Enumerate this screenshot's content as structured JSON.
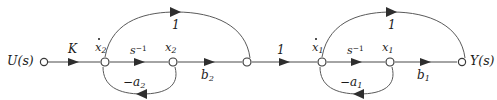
{
  "diagram": {
    "type": "signal-flow-graph",
    "title": "",
    "background_color": "#ffffff",
    "line_color": "#4a4a4a",
    "text_color": "#1a1a1a"
  },
  "nodes": [
    {
      "id": "u",
      "label": "U(s)",
      "label_plain": "U(s)",
      "x": 42,
      "y": 62
    },
    {
      "id": "xd2",
      "label": "x̄2",
      "label_plain": "x-dot 2",
      "x": 105,
      "y": 62
    },
    {
      "id": "x2",
      "label": "x2",
      "label_plain": "x2",
      "x": 173,
      "y": 62
    },
    {
      "id": "mid",
      "label": "",
      "label_plain": "junction",
      "x": 247,
      "y": 62
    },
    {
      "id": "xd1",
      "label": "x̄1",
      "label_plain": "x-dot 1",
      "x": 322,
      "y": 62
    },
    {
      "id": "x1",
      "label": "x1",
      "label_plain": "x1",
      "x": 390,
      "y": 62
    },
    {
      "id": "y",
      "label": "Y(s)",
      "label_plain": "Y(s)",
      "x": 462,
      "y": 62
    }
  ],
  "node_labels": {
    "u": "U(s)",
    "xdot2_base": "x",
    "xdot2_sub": "2",
    "x2_base": "x",
    "x2_sub": "2",
    "xdot1_base": "x",
    "xdot1_sub": "1",
    "x1_base": "x",
    "x1_sub": "1",
    "y": "Y(s)"
  },
  "edges": [
    {
      "id": "e-u-xd2",
      "from": "u",
      "to": "xd2",
      "gain": "K",
      "shape": "straight",
      "direction": "right"
    },
    {
      "id": "e-xd2-x2",
      "from": "xd2",
      "to": "x2",
      "gain": "s−1",
      "gain_base": "s",
      "gain_sup": "−1",
      "shape": "straight",
      "direction": "right"
    },
    {
      "id": "e-x2-mid",
      "from": "x2",
      "to": "mid",
      "gain": "b2",
      "gain_base": "b",
      "gain_sub": "2",
      "shape": "straight",
      "direction": "right"
    },
    {
      "id": "e-mid-xd1",
      "from": "mid",
      "to": "xd1",
      "gain": "1",
      "shape": "straight",
      "direction": "right"
    },
    {
      "id": "e-xd1-x1",
      "from": "xd1",
      "to": "x1",
      "gain": "s−1",
      "gain_base": "s",
      "gain_sup": "−1",
      "shape": "straight",
      "direction": "right"
    },
    {
      "id": "e-x1-y",
      "from": "x1",
      "to": "y",
      "gain": "b1",
      "gain_base": "b",
      "gain_sub": "1",
      "shape": "straight",
      "direction": "right"
    },
    {
      "id": "e-xd2-mid-top",
      "from": "xd2",
      "to": "mid",
      "gain": "1",
      "shape": "arc-above",
      "direction": "right"
    },
    {
      "id": "e-xd1-y-top",
      "from": "xd1",
      "to": "y",
      "gain": "1",
      "shape": "arc-above",
      "direction": "right"
    },
    {
      "id": "e-x2-xd2-fb",
      "from": "x2",
      "to": "xd2",
      "gain": "−a2",
      "gain_base": "−a",
      "gain_sub": "2",
      "shape": "arc-below",
      "direction": "left"
    },
    {
      "id": "e-x1-xd1-fb",
      "from": "x1",
      "to": "xd1",
      "gain": "−a1",
      "gain_base": "−a",
      "gain_sub": "1",
      "shape": "arc-below",
      "direction": "left"
    }
  ],
  "gain_labels": {
    "k": "K",
    "s_inv_base": "s",
    "s_inv_sup": "−1",
    "b2_base": "b",
    "b2_sub": "2",
    "b1_base": "b",
    "b1_sub": "1",
    "unity_top_left": "1",
    "unity_mid": "1",
    "unity_top_right": "1",
    "neg_a2_base": "−a",
    "neg_a2_sub": "2",
    "neg_a1_base": "−a",
    "neg_a1_sub": "1"
  }
}
